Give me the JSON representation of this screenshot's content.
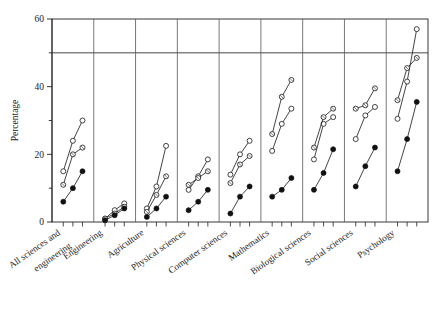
{
  "chart_data": {
    "type": "line",
    "title": "",
    "subtitle": "",
    "xlabel": "",
    "ylabel": "Percentage",
    "ylim": [
      0,
      60
    ],
    "yticks": [
      0,
      20,
      40,
      60
    ],
    "yminorticks": [
      10,
      30,
      50
    ],
    "grid": false,
    "panel_separators": true,
    "reference_line": 50,
    "legend": "none",
    "x": [
      1,
      2,
      3
    ],
    "categories": [
      "All sciences and engineering",
      "Engineering",
      "Agriculture",
      "Physical sciences",
      "Computer sciences",
      "Mathematics",
      "Biological sciences",
      "Social sciences",
      "Psychology"
    ],
    "series": [
      {
        "name": "series-1",
        "marker": "open-circle",
        "values": [
          [
            15.0,
            24.0,
            30.0
          ],
          [
            1.0,
            3.5,
            5.5
          ],
          [
            4.0,
            10.5,
            22.5
          ],
          [
            9.5,
            13.5,
            18.5
          ],
          [
            14.0,
            20.0,
            24.0
          ],
          [
            21.0,
            29.0,
            33.5
          ],
          [
            18.5,
            29.0,
            31.0
          ],
          [
            24.5,
            31.5,
            34.0
          ],
          [
            30.5,
            41.5,
            57.0
          ]
        ]
      },
      {
        "name": "series-2",
        "marker": "open-circle-dotted",
        "values": [
          [
            11.0,
            20.0,
            22.0
          ],
          [
            1.0,
            2.5,
            4.5
          ],
          [
            3.0,
            8.0,
            13.5
          ],
          [
            11.0,
            13.0,
            15.0
          ],
          [
            11.5,
            17.0,
            19.5
          ],
          [
            26.0,
            37.0,
            42.0
          ],
          [
            22.0,
            31.0,
            33.5
          ],
          [
            33.5,
            34.5,
            39.5
          ],
          [
            36.0,
            45.5,
            48.5
          ]
        ]
      },
      {
        "name": "series-3",
        "marker": "filled-circle",
        "values": [
          [
            6.0,
            10.0,
            15.0
          ],
          [
            0.5,
            2.0,
            4.0
          ],
          [
            1.5,
            4.0,
            7.5
          ],
          [
            3.5,
            6.0,
            9.5
          ],
          [
            2.5,
            7.5,
            10.5
          ],
          [
            7.5,
            9.5,
            13.0
          ],
          [
            9.5,
            14.5,
            21.5
          ],
          [
            10.5,
            16.5,
            22.0
          ],
          [
            15.0,
            24.5,
            35.5
          ]
        ]
      }
    ],
    "axis_colors": {
      "axis": "#222222",
      "reference_line": "#333333",
      "panel_divider": "#555555",
      "marker_open": "#ffffff",
      "marker_stroke": "#222222",
      "marker_filled": "#111111"
    }
  }
}
